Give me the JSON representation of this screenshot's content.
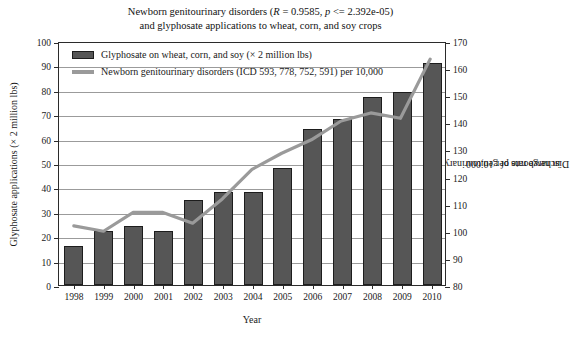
{
  "chart_data": {
    "type": "bar",
    "title": "Newborn genitourinary disorders (R = 0.9585, p <= 2.392e-05) and glyphosate applications to wheat, corn, and soy crops",
    "title_line1_pre": "Newborn genitourinary disorders (",
    "title_line1_r": "R",
    "title_line1_mid": " = 0.9585, ",
    "title_line1_p": "p",
    "title_line1_post": " <= 2.392e-05)",
    "title_line2": "and glyphosate applications to wheat, corn, and soy crops",
    "xlabel": "Year",
    "ylabel_left": "Glyphosate applications (× 2 million lbs)",
    "ylabel_right_line1": "Discharge rate of genitourinary disorders",
    "ylabel_right_line2": "in newborns per 10,000",
    "categories": [
      "1998",
      "1999",
      "2000",
      "2001",
      "2002",
      "2003",
      "2004",
      "2005",
      "2006",
      "2007",
      "2008",
      "2009",
      "2010"
    ],
    "ylim_left": [
      0,
      100
    ],
    "ytick_left": [
      0,
      10,
      20,
      30,
      40,
      50,
      60,
      70,
      80,
      90,
      100
    ],
    "ylim_right": [
      80,
      170
    ],
    "ytick_right": [
      80,
      90,
      100,
      110,
      120,
      130,
      140,
      150,
      160,
      170
    ],
    "grid": true,
    "legend_position": "upper-left-inside",
    "series": [
      {
        "name": "Glyphosate on wheat, corn, and soy (× 2 million lbs)",
        "kind": "bar",
        "axis": "left",
        "color": "#565656",
        "values": [
          16,
          22,
          24,
          22,
          35,
          38,
          38,
          48,
          64,
          68,
          77,
          79,
          91
        ]
      },
      {
        "name": "Newborn genitourinary disorders (ICD 593, 778, 752, 591) per 10,000",
        "kind": "line",
        "axis": "right",
        "color": "#9a9a9a",
        "values": [
          102,
          100,
          107,
          107,
          103,
          112,
          123,
          129,
          134,
          141,
          144,
          142,
          164
        ]
      }
    ]
  },
  "legend": {
    "items": [
      {
        "label": "Glyphosate on wheat, corn, and soy (× 2 million lbs)",
        "swatch": "bar-swatch"
      },
      {
        "label": "Newborn genitourinary disorders (ICD 593, 778, 752, 591) per 10,000",
        "swatch": "line-swatch"
      }
    ]
  },
  "colors": {
    "bar_fill": "#565656",
    "bar_edge": "#1d1d1d",
    "line": "#9a9a9a",
    "grid": "#9b9b9b",
    "axis": "#2b2b2b",
    "background": "#ffffff"
  }
}
